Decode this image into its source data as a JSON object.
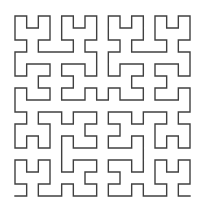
{
  "figure": {
    "kind": "space-filling-fractal-curve",
    "background_color": "#ffffff"
  },
  "curve": {
    "name": "hilbert-curve",
    "order": 4,
    "grid_cells_per_side": 16,
    "total_points": 256,
    "total_segments": 255,
    "stroke_color": "#404040",
    "stroke_width": 1.4,
    "fill": "none",
    "start_point_label": "bottom-left",
    "end_point_label": "bottom-right",
    "geometry": {
      "left": 15,
      "top": 16,
      "right": 190,
      "bottom": 196,
      "step_x": 11.6667,
      "step_y": 12.0
    }
  },
  "canvas": {
    "width": 205,
    "height": 212
  }
}
